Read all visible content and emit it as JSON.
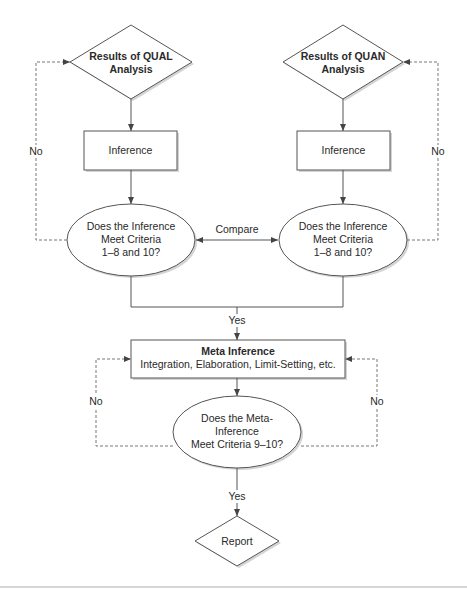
{
  "diagram": {
    "nodes": {
      "qual_results": {
        "line1": "Results of QUAL",
        "line2": "Analysis",
        "shape": "diamond"
      },
      "quan_results": {
        "line1": "Results of QUAN",
        "line2": "Analysis",
        "shape": "diamond"
      },
      "qual_inference": {
        "label": "Inference",
        "shape": "rectangle"
      },
      "quan_inference": {
        "label": "Inference",
        "shape": "rectangle"
      },
      "qual_check": {
        "line1": "Does the Inference",
        "line2": "Meet Criteria",
        "line3": "1–8 and 10?",
        "shape": "ellipse"
      },
      "quan_check": {
        "line1": "Does the Inference",
        "line2": "Meet Criteria",
        "line3": "1–8 and 10?",
        "shape": "ellipse"
      },
      "meta_inference": {
        "title": "Meta Inference",
        "subtitle": "Integration, Elaboration, Limit-Setting, etc.",
        "shape": "rectangle"
      },
      "meta_check": {
        "line1": "Does the Meta-",
        "line2": "Inference",
        "line3": "Meet Criteria 9–10?",
        "shape": "ellipse"
      },
      "report": {
        "label": "Report",
        "shape": "diamond"
      }
    },
    "edge_labels": {
      "compare": "Compare",
      "yes_merge": "Yes",
      "yes_report": "Yes",
      "no_qual": "No",
      "no_quan": "No",
      "no_meta_left": "No",
      "no_meta_right": "No"
    },
    "colors": {
      "stroke": "#555555",
      "shadow": "#cfcfcf",
      "dashed": "#777777",
      "text": "#2a2a2a"
    }
  }
}
